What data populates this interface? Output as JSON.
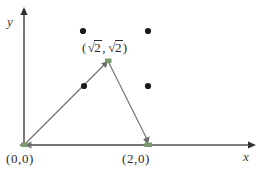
{
  "figure": {
    "type": "coordinate-geometry-diagram",
    "background_color": "#ffffff",
    "axes": {
      "x_label": "x",
      "y_label": "y",
      "x_axis_color": "#555555",
      "y_axis_color": "#555555",
      "origin_px": [
        24,
        145
      ]
    },
    "labels": {
      "origin": "(0,0)",
      "base_right": "(2,0)",
      "apex_open_paren": "(",
      "apex_radical_sign_1": "√",
      "apex_radicand_1": "2",
      "apex_comma": ",",
      "apex_radical_sign_2": "√",
      "apex_radicand_2": "2",
      "apex_close_paren": ")",
      "apex_full": "(√2 , √2)"
    },
    "triangle": {
      "stroke_color": "#6b6b6b",
      "vertex_color": "#7a9a6a",
      "vertices": [
        {
          "name": "origin",
          "label": "(0,0)",
          "px": [
            24,
            145
          ]
        },
        {
          "name": "apex",
          "label": "(√2 , √2)",
          "px": [
            108,
            61
          ]
        },
        {
          "name": "base-right",
          "label": "(2,0)",
          "px": [
            148,
            145
          ]
        }
      ]
    },
    "lattice_points": {
      "color": "#1a1a1a",
      "points": [
        {
          "name": "dot-upper-left",
          "px": [
            83,
            31
          ]
        },
        {
          "name": "dot-upper-right",
          "px": [
            148,
            31
          ]
        },
        {
          "name": "dot-mid-left",
          "px": [
            84,
            86
          ]
        },
        {
          "name": "dot-mid-right",
          "px": [
            148,
            86
          ]
        }
      ]
    }
  }
}
